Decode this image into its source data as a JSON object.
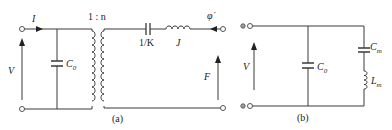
{
  "figure": {
    "panel_a": {
      "caption": "(a)",
      "labels": {
        "current": "I",
        "voltage": "V",
        "clamped_capacitor": "C",
        "clamped_capacitor_sub": "0",
        "transformer_ratio": "1 : n",
        "compliance": "1/K",
        "inertia": "J",
        "angular_velocity": "φ̇",
        "force": "F"
      }
    },
    "panel_b": {
      "caption": "(b)",
      "labels": {
        "voltage": "V",
        "clamped_capacitor": "C",
        "clamped_capacitor_sub": "0",
        "motional_capacitor": "C",
        "motional_capacitor_sub": "m",
        "motional_inductor": "L",
        "motional_inductor_sub": "m"
      }
    }
  }
}
